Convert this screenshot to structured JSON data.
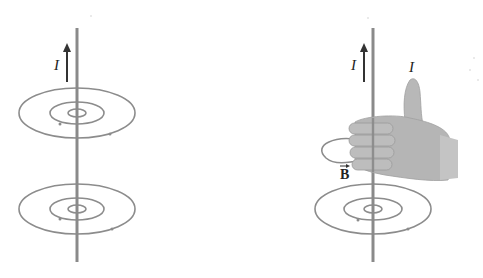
{
  "diagram": {
    "left_panel": {
      "current_label": "I",
      "description": "Straight current-carrying wire with concentric circular magnetic field lines"
    },
    "right_panel": {
      "current_label_wire": "I",
      "current_label_thumb": "I",
      "field_label": "B",
      "field_label_vector_arrow": "→",
      "description": "Right-hand rule: thumb points along current, curled fingers show magnetic field direction"
    },
    "colors": {
      "wire": "#8a8a8a",
      "field_lines": "#8c8c8c",
      "arrow": "#333333",
      "hand": "#b5b5b5"
    }
  }
}
